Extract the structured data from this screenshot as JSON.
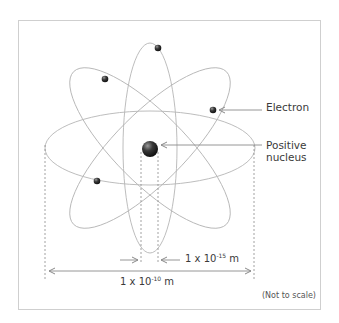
{
  "diagram": {
    "labels": {
      "electron": "Electron",
      "nucleus_line1": "Positive",
      "nucleus_line2": "nucleus",
      "nucleus_size": {
        "base": "1 x 10",
        "exponent": "-15",
        "unit": " m"
      },
      "atom_size": {
        "base": "1 x 10",
        "exponent": "-10",
        "unit": " m"
      },
      "note": "(Not to scale)"
    },
    "colors": {
      "orbit": "#b5b5b5",
      "arrow": "#8a8a8a",
      "dash": "#8a8a8a",
      "text": "#3a3a3a",
      "frame": "#cfcfcf",
      "particle": "#2a2a2a"
    },
    "orbits": [
      {
        "name": "horizontal",
        "cx": 150,
        "cy": 148,
        "rx": 105,
        "ry": 37,
        "rotate": 0
      },
      {
        "name": "vertical",
        "cx": 150,
        "cy": 148,
        "rx": 27,
        "ry": 105,
        "rotate": 0
      },
      {
        "name": "diagonal-down",
        "cx": 150,
        "cy": 148,
        "rx": 108,
        "ry": 35,
        "rotate": 45
      },
      {
        "name": "diagonal-up",
        "cx": 150,
        "cy": 148,
        "rx": 108,
        "ry": 35,
        "rotate": -45
      }
    ],
    "electrons": [
      {
        "x": 158,
        "y": 48
      },
      {
        "x": 105,
        "y": 79
      },
      {
        "x": 213,
        "y": 110
      },
      {
        "x": 97,
        "y": 181
      }
    ],
    "nucleus": {
      "x": 150,
      "y": 149,
      "r": 8
    }
  }
}
